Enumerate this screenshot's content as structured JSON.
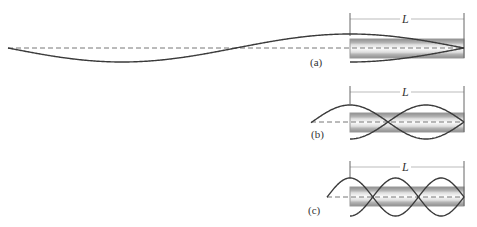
{
  "figure": {
    "panels": [
      {
        "id": "a",
        "label": "(a)",
        "dimension_label": "L",
        "mode": "quarter-wave fundamental",
        "tube_quarter_waves": 1
      },
      {
        "id": "b",
        "label": "(b)",
        "dimension_label": "L",
        "mode": "third harmonic",
        "tube_quarter_waves": 3
      },
      {
        "id": "c",
        "label": "(c)",
        "dimension_label": "L",
        "mode": "fifth harmonic",
        "tube_quarter_waves": 5
      }
    ]
  },
  "colors": {
    "wave": "#3a3a3a",
    "axis_dash": "#777777",
    "tube_band": "#9e9e9e",
    "tube_fill": "#e4e4e4",
    "dimension_line": "#999999"
  }
}
